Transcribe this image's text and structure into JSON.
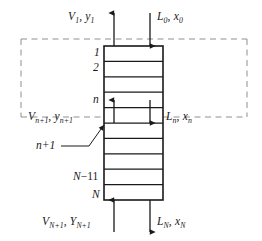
{
  "figure": {
    "name": "countercurrent-staged-column",
    "colors": {
      "line": "#1a1a1a",
      "dashed_envelope": "#8a8a8a",
      "background": "#ffffff",
      "text": "#1a1a1a"
    }
  },
  "streams": {
    "top_vapor_out": {
      "label_V": "V",
      "label_V_sub": "1",
      "separator": ", ",
      "label_y": "y",
      "label_y_sub": "1",
      "text": "V1, y1",
      "direction": "up"
    },
    "top_liquid_in": {
      "label_L": "L",
      "label_L_sub": "0",
      "separator": ", ",
      "label_x": "x",
      "label_x_sub": "0",
      "text": "L0, x0",
      "direction": "down"
    },
    "mid_vapor": {
      "label_V": "V",
      "label_V_sub": "n+1",
      "separator": ", ",
      "label_y": "y",
      "label_y_sub": "n+1",
      "text": "Vn+1, yn+1",
      "direction": "up"
    },
    "mid_liquid": {
      "label_L": "L",
      "label_L_sub": "n",
      "separator": ", ",
      "label_x": "x",
      "label_x_sub": "n",
      "text": "Ln, xn",
      "direction": "down"
    },
    "bottom_vapor_in": {
      "label_V": "V",
      "label_V_sub": "N+1",
      "separator": ", ",
      "label_y": "Y",
      "label_y_sub": "N+1",
      "text": "VN+1, YN+1",
      "direction": "up"
    },
    "bottom_liquid_out": {
      "label_L": "L",
      "label_L_sub": "N",
      "separator": ", ",
      "label_x": "x",
      "label_x_sub": "N",
      "text": "LN, xN",
      "direction": "down"
    }
  },
  "stages": [
    {
      "id": "stage-1",
      "label": "1",
      "sub": ""
    },
    {
      "id": "stage-2",
      "label": "2",
      "sub": ""
    },
    {
      "id": "stage-n",
      "label": "n",
      "sub": ""
    },
    {
      "id": "stage-n1",
      "label": "n",
      "sub": "+1",
      "callout": true
    },
    {
      "id": "stage-Nm1",
      "label": "N",
      "sub": "−1"
    },
    {
      "id": "stage-N",
      "label": "N",
      "sub": ""
    }
  ],
  "annotations": {
    "n_plus_1_callout": "n+1",
    "envelope_style": "dashed"
  }
}
